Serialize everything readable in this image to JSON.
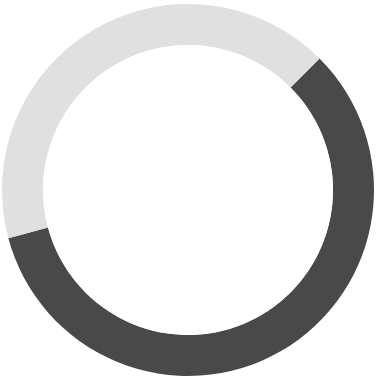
{
  "figure": {
    "background_color": "#ffffff",
    "width": 385,
    "height": 386
  },
  "chart_data": {
    "type": "pie",
    "variant": "donut",
    "title": "",
    "subtitle": "",
    "xlabel": "",
    "ylabel": "",
    "grid": false,
    "legend": "none",
    "labels": [
      "Segment 1",
      "Segment 2"
    ],
    "values": [
      58.3,
      41.7
    ],
    "percentages": [
      "58.3%",
      "41.7%"
    ],
    "colors": [
      "#494949",
      "#e0e0e0"
    ],
    "annotations": [],
    "tick_labels": [],
    "geometry": {
      "center_x": 188,
      "center_y": 190,
      "outer_radius": 186,
      "inner_radius": 145,
      "hole_fraction": 0.78,
      "start_angle_deg": -45,
      "direction": "clockwise"
    },
    "slices": [
      {
        "name": "Segment 1",
        "color": "#494949",
        "value": 58.3,
        "start_angle_deg": -45,
        "end_angle_deg": 165,
        "sweep_deg": 210
      },
      {
        "name": "Segment 2",
        "color": "#e0e0e0",
        "value": 41.7,
        "start_angle_deg": 165,
        "end_angle_deg": 315,
        "sweep_deg": 150
      }
    ]
  },
  "accessibility": {
    "chart_description": "Donut chart with two segments"
  }
}
